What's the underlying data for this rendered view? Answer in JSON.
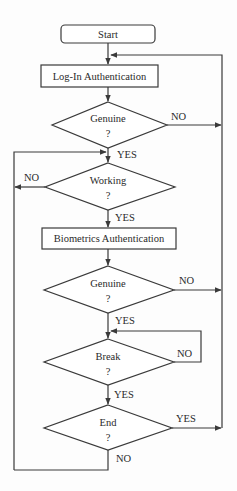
{
  "diagram": {
    "type": "flowchart",
    "nodes": {
      "start": {
        "label": "Start",
        "shape": "rounded-rect"
      },
      "login": {
        "label": "Log-In Authentication",
        "shape": "rect"
      },
      "genuine1": {
        "label": "Genuine",
        "q": "?",
        "shape": "diamond"
      },
      "working": {
        "label": "Working",
        "q": "?",
        "shape": "diamond"
      },
      "biometrics": {
        "label": "Biometrics Authentication",
        "shape": "rect"
      },
      "genuine2": {
        "label": "Genuine",
        "q": "?",
        "shape": "diamond"
      },
      "break": {
        "label": "Break",
        "q": "?",
        "shape": "diamond"
      },
      "end": {
        "label": "End",
        "q": "?",
        "shape": "diamond"
      }
    },
    "edge_labels": {
      "genuine1_no": "NO",
      "genuine1_yes": "YES",
      "working_no": "NO",
      "working_yes": "YES",
      "genuine2_no": "NO",
      "genuine2_yes": "YES",
      "break_no": "NO",
      "break_yes": "YES",
      "end_yes": "YES",
      "end_no": "NO"
    },
    "edges": [
      {
        "from": "start",
        "to": "login"
      },
      {
        "from": "login",
        "to": "genuine1"
      },
      {
        "from": "genuine1",
        "to": "login",
        "label": "NO"
      },
      {
        "from": "genuine1",
        "to": "working",
        "label": "YES"
      },
      {
        "from": "working",
        "to": "working",
        "label": "NO"
      },
      {
        "from": "working",
        "to": "biometrics",
        "label": "YES"
      },
      {
        "from": "biometrics",
        "to": "genuine2"
      },
      {
        "from": "genuine2",
        "to": "login",
        "label": "NO"
      },
      {
        "from": "genuine2",
        "to": "break",
        "label": "YES"
      },
      {
        "from": "break",
        "to": "break",
        "label": "NO"
      },
      {
        "from": "break",
        "to": "end",
        "label": "YES"
      },
      {
        "from": "end",
        "to": "login",
        "label": "YES"
      },
      {
        "from": "end",
        "to": "working",
        "label": "NO"
      }
    ]
  }
}
